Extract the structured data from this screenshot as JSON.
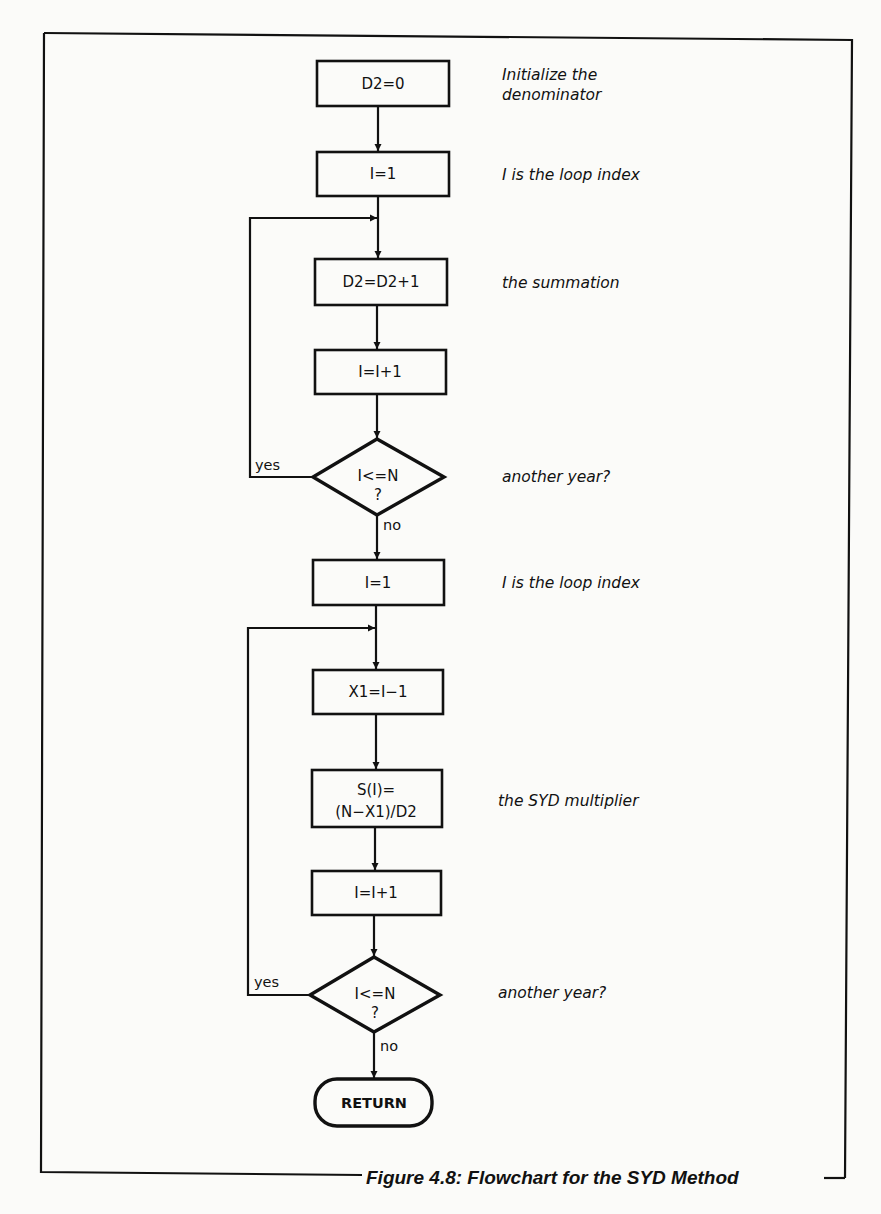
{
  "page": {
    "clipped_heading_fragment": "ppp g"
  },
  "figure": {
    "caption": "Figure 4.8: Flowchart for the SYD Method",
    "steps": [
      {
        "id": "s1",
        "shape": "process",
        "text": "D2=0",
        "note": [
          "Initialize the",
          "denominator"
        ]
      },
      {
        "id": "s2",
        "shape": "process",
        "text": "I=1",
        "note": [
          "I is the loop index"
        ]
      },
      {
        "id": "s3",
        "shape": "process",
        "text": "D2=D2+1",
        "note": [
          "the summation"
        ]
      },
      {
        "id": "s4",
        "shape": "process",
        "text": "I=I+1",
        "note": []
      },
      {
        "id": "d1",
        "shape": "decision",
        "text": [
          "I<=N",
          "?"
        ],
        "note": [
          "another year?"
        ],
        "yes_label": "yes",
        "no_label": "no"
      },
      {
        "id": "s5",
        "shape": "process",
        "text": "I=1",
        "note": [
          "I is the loop index"
        ]
      },
      {
        "id": "s6",
        "shape": "process",
        "text": "X1=I−1",
        "note": []
      },
      {
        "id": "s7",
        "shape": "process",
        "text": [
          "S(I)=",
          "(N−X1)/D2"
        ],
        "note": [
          "the SYD multiplier"
        ]
      },
      {
        "id": "s8",
        "shape": "process",
        "text": "I=I+1",
        "note": []
      },
      {
        "id": "d2",
        "shape": "decision",
        "text": [
          "I<=N",
          "?"
        ],
        "note": [
          "another year?"
        ],
        "yes_label": "yes",
        "no_label": "no"
      },
      {
        "id": "t1",
        "shape": "terminator",
        "text": "RETURN",
        "note": []
      }
    ]
  }
}
